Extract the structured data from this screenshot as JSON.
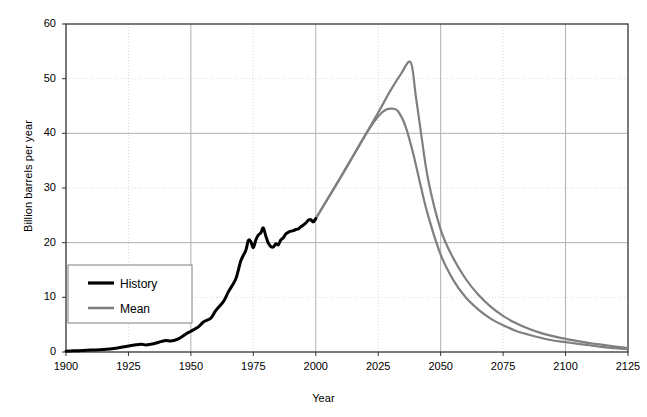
{
  "chart_data": {
    "type": "line",
    "title": "",
    "xlabel": "Year",
    "ylabel": "Billion barrels per year",
    "xlim": [
      1900,
      2125
    ],
    "ylim": [
      0,
      60
    ],
    "xticks": [
      1900,
      1925,
      1950,
      1975,
      2000,
      2025,
      2050,
      2075,
      2100,
      2125
    ],
    "yticks": [
      0,
      10,
      20,
      30,
      40,
      50,
      60
    ],
    "grid": true,
    "legend_position": "inside-left",
    "legend": [
      {
        "label": "History",
        "color": "#000000"
      },
      {
        "label": "Mean",
        "color": "#7f7f7f"
      }
    ],
    "series": [
      {
        "name": "History",
        "color": "#000000",
        "x": [
          1900,
          1905,
          1910,
          1915,
          1920,
          1925,
          1930,
          1932,
          1935,
          1938,
          1940,
          1942,
          1945,
          1948,
          1950,
          1953,
          1955,
          1958,
          1960,
          1963,
          1965,
          1968,
          1970,
          1972,
          1973,
          1974,
          1975,
          1976,
          1977,
          1978,
          1979,
          1980,
          1981,
          1982,
          1983,
          1984,
          1985,
          1986,
          1987,
          1988,
          1989,
          1990,
          1991,
          1992,
          1993,
          1994,
          1995,
          1996,
          1997,
          1998,
          1999,
          2000
        ],
        "y": [
          0.15,
          0.25,
          0.35,
          0.45,
          0.7,
          1.1,
          1.4,
          1.3,
          1.5,
          1.9,
          2.1,
          2.0,
          2.4,
          3.3,
          3.8,
          4.6,
          5.5,
          6.2,
          7.6,
          9.2,
          11.0,
          13.4,
          16.7,
          18.6,
          20.4,
          20.2,
          19.1,
          20.5,
          21.4,
          21.8,
          22.7,
          21.2,
          19.9,
          19.3,
          19.2,
          19.8,
          19.6,
          20.5,
          20.9,
          21.6,
          21.9,
          22.1,
          22.2,
          22.4,
          22.5,
          22.9,
          23.2,
          23.6,
          24.1,
          24.2,
          23.8,
          24.4
        ]
      },
      {
        "name": "Mean (sharp peak)",
        "color": "#7f7f7f",
        "x": [
          2000,
          2005,
          2010,
          2015,
          2020,
          2025,
          2030,
          2034,
          2038,
          2040,
          2042,
          2045,
          2050,
          2055,
          2060,
          2065,
          2070,
          2075,
          2080,
          2085,
          2090,
          2095,
          2100,
          2105,
          2110,
          2115,
          2120,
          2125
        ],
        "y": [
          24.4,
          28.2,
          32.0,
          35.9,
          39.8,
          43.8,
          47.9,
          50.8,
          53.0,
          47.0,
          40.5,
          31.5,
          22.4,
          17.2,
          13.4,
          10.5,
          8.3,
          6.6,
          5.3,
          4.3,
          3.5,
          2.9,
          2.4,
          2.0,
          1.6,
          1.3,
          1.0,
          0.7
        ]
      },
      {
        "name": "Mean (rounded peak)",
        "color": "#7f7f7f",
        "x": [
          2000,
          2005,
          2010,
          2015,
          2020,
          2025,
          2028,
          2031,
          2033,
          2036,
          2039,
          2042,
          2045,
          2050,
          2055,
          2060,
          2065,
          2070,
          2075,
          2080,
          2085,
          2090,
          2095,
          2100,
          2105,
          2110,
          2115,
          2120,
          2125
        ],
        "y": [
          24.4,
          28.2,
          32.0,
          35.9,
          39.8,
          43.1,
          44.3,
          44.5,
          44.0,
          41.2,
          36.3,
          30.4,
          24.9,
          17.8,
          13.2,
          10.0,
          7.8,
          6.1,
          4.9,
          3.9,
          3.2,
          2.6,
          2.1,
          1.8,
          1.5,
          1.2,
          0.9,
          0.7,
          0.5
        ]
      }
    ]
  },
  "colors": {
    "history": "#000000",
    "mean": "#7f7f7f",
    "grid_solid": "#b0b0b0",
    "grid_dotted": "#d8d8d8",
    "axis": "#333333",
    "background": "#ffffff"
  }
}
